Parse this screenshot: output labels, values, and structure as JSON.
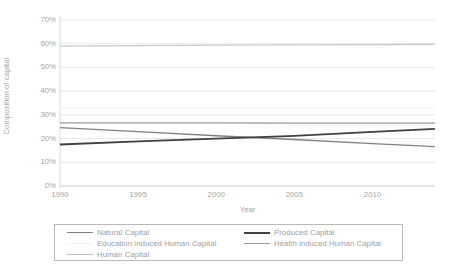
{
  "chart_data": {
    "type": "line",
    "title": "",
    "xlabel": "Year",
    "ylabel": "Composition of capital",
    "xlim": [
      1990,
      2014
    ],
    "ylim": [
      0,
      70
    ],
    "grid": true,
    "legend_position": "bottom",
    "x_ticks": [
      "1990",
      "1995",
      "2000",
      "2005",
      "2010"
    ],
    "x_tick_values": [
      1990,
      1995,
      2000,
      2005,
      2010
    ],
    "y_ticks": [
      "0%",
      "10%",
      "20%",
      "30%",
      "40%",
      "50%",
      "60%",
      "70%"
    ],
    "y_tick_values": [
      0,
      10,
      20,
      30,
      40,
      50,
      60,
      70
    ],
    "x": [
      1990,
      1995,
      2000,
      2005,
      2010,
      2014
    ],
    "series": [
      {
        "name": "Natural Capital",
        "color": "#808080",
        "width": 1.3,
        "values": [
          24.6,
          22.9,
          21.2,
          19.6,
          17.9,
          16.6
        ]
      },
      {
        "name": "Produced Capital",
        "color": "#404040",
        "width": 1.8,
        "values": [
          17.5,
          18.8,
          20.0,
          21.1,
          22.8,
          24.1
        ]
      },
      {
        "name": "Education induced Human Capital",
        "color": "#f0f0f0",
        "width": 1.1,
        "values": [
          32.8,
          32.8,
          32.8,
          32.8,
          32.8,
          32.8
        ]
      },
      {
        "name": "Health induced Human Capital",
        "color": "#9a9a9a",
        "width": 1.2,
        "values": [
          26.6,
          26.6,
          26.6,
          26.5,
          26.5,
          26.5
        ]
      },
      {
        "name": "Human Capital",
        "color": "#c8c8c8",
        "width": 1.2,
        "values": [
          59.0,
          59.2,
          59.4,
          59.5,
          59.6,
          59.7
        ]
      }
    ]
  },
  "axes": {
    "y_title": "Composition of capital",
    "x_title": "Year"
  },
  "legend": {
    "rows": [
      {
        "left": {
          "label": "Natural Capital",
          "color": "#808080",
          "width": "1.6px"
        },
        "right": {
          "label": "Produced Capital",
          "color": "#404040",
          "width": "2px"
        }
      },
      {
        "left": {
          "label": "Education induced Human Capital",
          "color": "#f2f2f2",
          "width": "1.2px"
        },
        "right": {
          "label": "Health induced Human Capital",
          "color": "#9a9a9a",
          "width": "1.4px"
        }
      },
      {
        "left": {
          "label": "Human Capital",
          "color": "#c0c0c0",
          "width": "1.4px"
        },
        "right": {
          "label": "",
          "color": "transparent",
          "width": "0px"
        }
      }
    ]
  },
  "colors": {
    "gridline": "#e8e8e8",
    "axis_line": "#d9d9d9",
    "tick_text": "#a6a6a6",
    "legend_border": "#b9b9b9",
    "background": "#ffffff"
  }
}
